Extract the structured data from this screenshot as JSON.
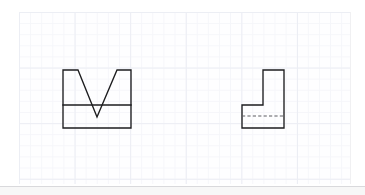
{
  "canvas": {
    "width": 365,
    "height": 195,
    "background_color": "#ffffff",
    "label": "engineering-sketch-canvas"
  },
  "paper": {
    "name": "graph-paper",
    "x": 19,
    "y": 12,
    "width": 332,
    "height": 172,
    "fill_color": "#fefeff",
    "minor_grid_color": "#f5f6fa",
    "major_grid_color": "#eceef4",
    "minor_spacing_px": 11.1,
    "major_spacing_px": 55.6,
    "grid_visible": true
  },
  "footer": {
    "divider_color": "#d9d9dc",
    "strip_color": "#f7f7f7"
  },
  "style": {
    "object_line_color": "#1d1d1f",
    "object_line_width": 1.35,
    "hidden_line_color": "#5d5d63",
    "hidden_line_width": 1.1,
    "hidden_line_dash": "3.2 2.2"
  },
  "drawing": {
    "title": "Orthographic two-view sketch",
    "views": [
      {
        "name": "front-view-vee-block",
        "description": "Rectangular block with a symmetric V notch cut into the top edge and a horizontal division line across the lower body",
        "outline_points": [
          [
            63,
            70
          ],
          [
            78,
            70
          ],
          [
            97,
            117
          ],
          [
            117,
            70
          ],
          [
            131,
            70
          ],
          [
            131,
            128
          ],
          [
            63,
            128
          ]
        ],
        "closed": true,
        "internal_lines": [
          {
            "name": "horizontal-division-line",
            "type": "object",
            "points": [
              [
                63,
                105
              ],
              [
                131,
                105
              ]
            ]
          }
        ],
        "bounds": {
          "x": 63,
          "y": 70,
          "width": 68,
          "height": 58
        }
      },
      {
        "name": "side-view-l-block",
        "description": "L shaped stepped profile with a dashed hidden line marking the internal base level",
        "outline_points": [
          [
            242,
            105
          ],
          [
            263,
            105
          ],
          [
            263,
            70
          ],
          [
            284,
            70
          ],
          [
            284,
            128
          ],
          [
            242,
            128
          ]
        ],
        "closed": true,
        "internal_lines": [
          {
            "name": "hidden-base-line",
            "type": "hidden",
            "points": [
              [
                242,
                116
              ],
              [
                284,
                116
              ]
            ]
          }
        ],
        "bounds": {
          "x": 242,
          "y": 70,
          "width": 42,
          "height": 58
        }
      }
    ]
  }
}
